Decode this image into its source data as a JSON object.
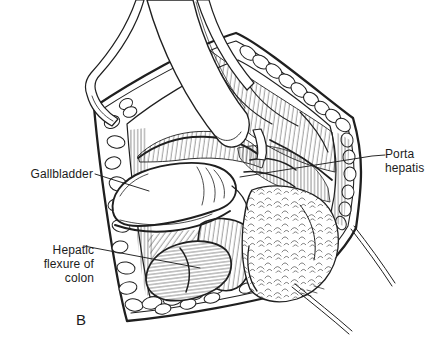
{
  "figure": {
    "type": "surgical-anatomy-illustration",
    "panel_letter": "B",
    "background_color": "#ffffff",
    "ink_color": "#1f1f1f",
    "labels": [
      {
        "id": "gallbladder",
        "text": "Gallbladder"
      },
      {
        "id": "porta-hepatis",
        "text": "Porta hepatis"
      },
      {
        "id": "hepatic-flexure-of-colon",
        "text": "Hepatic flexure of colon"
      }
    ]
  }
}
